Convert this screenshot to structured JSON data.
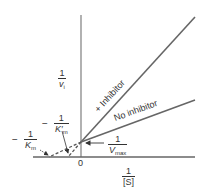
{
  "diagram": {
    "type": "Lineweaver-Burk plot",
    "y_axis_label": {
      "numerator": "1",
      "denominator": "v",
      "subscript": "i"
    },
    "x_axis_label": {
      "numerator": "1",
      "denominator": "[S]"
    },
    "origin_label": "0",
    "lines": [
      {
        "name": "+ Inhibitor",
        "label": "+ Inhibitor"
      },
      {
        "name": "No inhibitor",
        "label": "No inhibitor"
      }
    ],
    "annotations": {
      "vmax": {
        "numerator": "1",
        "denominator": "V",
        "subscript": "max"
      },
      "km": {
        "sign": "−",
        "numerator": "1",
        "denominator": "K",
        "subscript": "m"
      },
      "km_prime": {
        "sign": "−",
        "numerator": "1",
        "denominator": "K′",
        "subscript": "m"
      }
    },
    "colors": {
      "lines": "#555555",
      "axes": "#777777",
      "text": "#333333"
    }
  }
}
